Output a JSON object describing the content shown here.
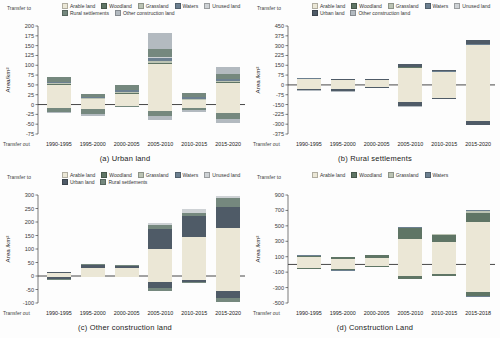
{
  "figure": {
    "background": "#fdfdfd"
  },
  "legend_labels": {
    "arable": "Arable land",
    "woodland": "Woodland",
    "grassland": "Grassland",
    "waters": "Waters",
    "unused": "Unused land",
    "urban": "Urban land",
    "rural": "Rural settlements",
    "other": "Other construction land"
  },
  "palette": {
    "arable": "#ebe7d6",
    "woodland": "#5f7565",
    "grassland": "#bcc4b4",
    "waters": "#6c8090",
    "unused": "#ced2d5",
    "urban": "#4f5b67",
    "rural": "#75887e",
    "other": "#b3bac0",
    "axis": "#444444",
    "tick_text": "#3a3a3a"
  },
  "chart_data": [
    {
      "type": "bar",
      "id": "a",
      "title": "(a) Urban land",
      "transfer_to": "Transfer to",
      "transfer_out": "Transfer out",
      "ylabel": "Area/km²",
      "ymin": -75,
      "ymax": 200,
      "ystep": 25,
      "grid": false,
      "legend_position": "top",
      "legend_rows": [
        [
          "arable",
          "woodland",
          "grassland",
          "waters",
          "unused"
        ],
        [
          "rural",
          "other"
        ]
      ],
      "categories": [
        "1990-1995",
        "1995-2000",
        "2000-2005",
        "2005-2010",
        "2010-2015",
        "2015-2020"
      ],
      "bars": [
        {
          "pos": [
            [
              "arable",
              50
            ],
            [
              "woodland",
              2
            ],
            [
              "grassland",
              2
            ],
            [
              "waters",
              4
            ],
            [
              "rural",
              12
            ]
          ],
          "neg": [
            [
              "arable",
              8
            ],
            [
              "rural",
              10
            ],
            [
              "other",
              4
            ]
          ]
        },
        {
          "pos": [
            [
              "arable",
              15
            ],
            [
              "grassland",
              1
            ],
            [
              "waters",
              2
            ],
            [
              "rural",
              10
            ]
          ],
          "neg": [
            [
              "arable",
              12
            ],
            [
              "rural",
              12
            ],
            [
              "other",
              6
            ]
          ]
        },
        {
          "pos": [
            [
              "arable",
              28
            ],
            [
              "woodland",
              2
            ],
            [
              "grassland",
              2
            ],
            [
              "waters",
              4
            ],
            [
              "rural",
              14
            ]
          ],
          "neg": [
            [
              "arable",
              3
            ],
            [
              "rural",
              3
            ]
          ]
        },
        {
          "pos": [
            [
              "arable",
              103
            ],
            [
              "woodland",
              3
            ],
            [
              "grassland",
              4
            ],
            [
              "waters",
              8
            ],
            [
              "unused",
              2
            ],
            [
              "rural",
              22
            ],
            [
              "other",
              40
            ]
          ],
          "neg": [
            [
              "arable",
              16
            ],
            [
              "rural",
              14
            ],
            [
              "other",
              10
            ]
          ]
        },
        {
          "pos": [
            [
              "arable",
              12
            ],
            [
              "grassland",
              2
            ],
            [
              "waters",
              4
            ],
            [
              "rural",
              12
            ]
          ],
          "neg": [
            [
              "arable",
              8
            ],
            [
              "rural",
              7
            ],
            [
              "other",
              3
            ]
          ]
        },
        {
          "pos": [
            [
              "arable",
              55
            ],
            [
              "woodland",
              2
            ],
            [
              "grassland",
              3
            ],
            [
              "waters",
              4
            ],
            [
              "rural",
              13
            ],
            [
              "other",
              18
            ]
          ],
          "neg": [
            [
              "arable",
              22
            ],
            [
              "rural",
              15
            ],
            [
              "other",
              11
            ]
          ]
        }
      ]
    },
    {
      "type": "bar",
      "id": "b",
      "title": "(b) Rural settlements",
      "transfer_to": "Transfer to",
      "transfer_out": "Transfer out",
      "ylabel": "Area /km²",
      "ymin": -375,
      "ymax": 450,
      "ystep": 75,
      "grid": false,
      "legend_position": "top",
      "legend_rows": [
        [
          "arable",
          "woodland",
          "grassland",
          "waters",
          "unused"
        ],
        [
          "urban",
          "other"
        ]
      ],
      "categories": [
        "1990-1995",
        "1995-2000",
        "2000-2005",
        "2005-2010",
        "2010-2015",
        "2015-2020"
      ],
      "bars": [
        {
          "pos": [
            [
              "arable",
              45
            ],
            [
              "woodland",
              2
            ],
            [
              "waters",
              2
            ],
            [
              "urban",
              6
            ]
          ],
          "neg": [
            [
              "arable",
              30
            ],
            [
              "urban",
              10
            ],
            [
              "other",
              5
            ]
          ]
        },
        {
          "pos": [
            [
              "arable",
              38
            ],
            [
              "waters",
              2
            ],
            [
              "urban",
              5
            ]
          ],
          "neg": [
            [
              "arable",
              35
            ],
            [
              "urban",
              14
            ],
            [
              "other",
              6
            ]
          ]
        },
        {
          "pos": [
            [
              "arable",
              38
            ],
            [
              "waters",
              2
            ],
            [
              "urban",
              5
            ]
          ],
          "neg": [
            [
              "arable",
              14
            ],
            [
              "urban",
              8
            ],
            [
              "other",
              3
            ]
          ]
        },
        {
          "pos": [
            [
              "arable",
              132
            ],
            [
              "woodland",
              2
            ],
            [
              "waters",
              3
            ],
            [
              "urban",
              23
            ]
          ],
          "neg": [
            [
              "arable",
              130
            ],
            [
              "urban",
              30
            ],
            [
              "other",
              5
            ]
          ]
        },
        {
          "pos": [
            [
              "arable",
              103
            ],
            [
              "waters",
              2
            ],
            [
              "urban",
              10
            ]
          ],
          "neg": [
            [
              "arable",
              97
            ],
            [
              "urban",
              10
            ],
            [
              "other",
              3
            ]
          ]
        },
        {
          "pos": [
            [
              "arable",
              306
            ],
            [
              "woodland",
              2
            ],
            [
              "waters",
              4
            ],
            [
              "urban",
              33
            ]
          ],
          "neg": [
            [
              "arable",
              277
            ],
            [
              "urban",
              29
            ],
            [
              "other",
              4
            ]
          ]
        }
      ]
    },
    {
      "type": "bar",
      "id": "c",
      "title": "(c) Other construction land",
      "transfer_to": "Transfer to",
      "transfer_out": "Transfer out",
      "ylabel": "Area /km²",
      "ymin": -100,
      "ymax": 300,
      "ystep": 50,
      "grid": false,
      "legend_position": "top",
      "legend_rows": [
        [
          "arable",
          "woodland",
          "grassland",
          "waters",
          "unused"
        ],
        [
          "urban",
          "rural"
        ]
      ],
      "categories": [
        "1990-1995",
        "1995-2000",
        "2000-2005",
        "2005-2010",
        "2010-2015",
        "2015-2020"
      ],
      "bars": [
        {
          "pos": [
            [
              "arable",
              10
            ],
            [
              "urban",
              3
            ]
          ],
          "neg": [
            [
              "arable",
              5
            ],
            [
              "urban",
              6
            ],
            [
              "rural",
              2
            ]
          ]
        },
        {
          "pos": [
            [
              "arable",
              29
            ],
            [
              "urban",
              13
            ],
            [
              "rural",
              1
            ]
          ],
          "neg": [
            [
              "arable",
              3
            ],
            [
              "urban",
              2
            ]
          ]
        },
        {
          "pos": [
            [
              "arable",
              28
            ],
            [
              "urban",
              10
            ],
            [
              "rural",
              2
            ]
          ],
          "neg": [
            [
              "arable",
              3
            ],
            [
              "urban",
              2
            ]
          ]
        },
        {
          "pos": [
            [
              "arable",
              99
            ],
            [
              "urban",
              76
            ],
            [
              "rural",
              15
            ],
            [
              "unused",
              7
            ]
          ],
          "neg": [
            [
              "arable",
              24
            ],
            [
              "urban",
              21
            ],
            [
              "rural",
              10
            ]
          ]
        },
        {
          "pos": [
            [
              "arable",
              146
            ],
            [
              "urban",
              78
            ],
            [
              "rural",
              8
            ],
            [
              "unused",
              16
            ]
          ],
          "neg": [
            [
              "arable",
              13
            ],
            [
              "urban",
              9
            ],
            [
              "rural",
              3
            ]
          ]
        },
        {
          "pos": [
            [
              "arable",
              179
            ],
            [
              "urban",
              76
            ],
            [
              "rural",
              33
            ],
            [
              "unused",
              7
            ]
          ],
          "neg": [
            [
              "arable",
              55
            ],
            [
              "urban",
              26
            ],
            [
              "rural",
              16
            ]
          ]
        }
      ]
    },
    {
      "type": "bar",
      "id": "d",
      "title": "(d) Construction Land",
      "transfer_to": "Transfer to",
      "transfer_out": "Transfer out",
      "ylabel": "Area /km²",
      "ymin": -500,
      "ymax": 900,
      "ystep": 200,
      "grid": false,
      "legend_position": "top",
      "legend_rows": [
        [
          "arable",
          "woodland",
          "grassland",
          "waters"
        ]
      ],
      "categories": [
        "1990-1995",
        "1995-2000",
        "2000-2005",
        "2005-2010",
        "2010-2015",
        "2015-2018"
      ],
      "bars": [
        {
          "pos": [
            [
              "arable",
              93
            ],
            [
              "woodland",
              21
            ],
            [
              "grassland",
              3
            ],
            [
              "waters",
              3
            ]
          ],
          "neg": [
            [
              "arable",
              40
            ],
            [
              "woodland",
              17
            ],
            [
              "waters",
              3
            ]
          ]
        },
        {
          "pos": [
            [
              "arable",
              68
            ],
            [
              "woodland",
              26
            ],
            [
              "grassland",
              3
            ],
            [
              "waters",
              3
            ]
          ],
          "neg": [
            [
              "arable",
              53
            ],
            [
              "woodland",
              23
            ],
            [
              "waters",
              4
            ]
          ]
        },
        {
          "pos": [
            [
              "arable",
              88
            ],
            [
              "woodland",
              31
            ],
            [
              "grassland",
              3
            ],
            [
              "waters",
              3
            ]
          ],
          "neg": [
            [
              "arable",
              20
            ],
            [
              "woodland",
              8
            ],
            [
              "waters",
              2
            ]
          ]
        },
        {
          "pos": [
            [
              "arable",
              328
            ],
            [
              "woodland",
              140
            ],
            [
              "grassland",
              10
            ],
            [
              "waters",
              12
            ]
          ],
          "neg": [
            [
              "arable",
              153
            ],
            [
              "woodland",
              32
            ],
            [
              "waters",
              5
            ]
          ]
        },
        {
          "pos": [
            [
              "arable",
              288
            ],
            [
              "woodland",
              98
            ],
            [
              "grassland",
              6
            ],
            [
              "waters",
              8
            ]
          ],
          "neg": [
            [
              "arable",
              122
            ],
            [
              "woodland",
              28
            ],
            [
              "waters",
              5
            ]
          ]
        },
        {
          "pos": [
            [
              "arable",
              552
            ],
            [
              "woodland",
              118
            ],
            [
              "grassland",
              20
            ],
            [
              "waters",
              20
            ]
          ],
          "neg": [
            [
              "arable",
              358
            ],
            [
              "woodland",
              55
            ],
            [
              "waters",
              7
            ]
          ]
        }
      ]
    }
  ]
}
